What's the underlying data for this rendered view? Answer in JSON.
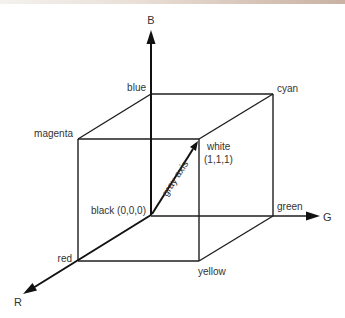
{
  "diagram": {
    "axes": {
      "r": "R",
      "g": "G",
      "b": "B"
    },
    "vertices": {
      "black": "black (0,0,0)",
      "red": "red",
      "green": "green",
      "blue": "blue",
      "yellow": "yellow",
      "cyan": "cyan",
      "magenta": "magenta",
      "white_name": "white",
      "white_coord": "(1,1,1)"
    },
    "diagonal_label": "gray axis",
    "colors": {
      "line": "#1e1e1e",
      "text": "#333333",
      "background": "#ffffff"
    }
  }
}
